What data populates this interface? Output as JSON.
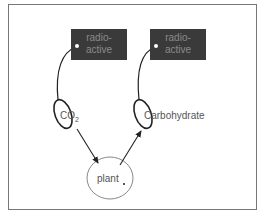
{
  "diagram": {
    "nodes": [
      {
        "id": "radioactive-left",
        "label_line1": "radio-",
        "label_line2": "active"
      },
      {
        "id": "radioactive-right",
        "label_line1": "radio-",
        "label_line2": "active"
      },
      {
        "id": "co2",
        "label": "CO",
        "subscript": "2"
      },
      {
        "id": "carbohydrate",
        "label": "Carbohydrate"
      },
      {
        "id": "plant",
        "label": "plant"
      }
    ],
    "edges": [
      {
        "from": "co2",
        "to": "plant"
      },
      {
        "from": "plant",
        "to": "carbohydrate"
      }
    ],
    "tags": [
      {
        "tag": "radioactive-left",
        "attached_to": "co2"
      },
      {
        "tag": "radioactive-right",
        "attached_to": "carbohydrate"
      }
    ]
  }
}
